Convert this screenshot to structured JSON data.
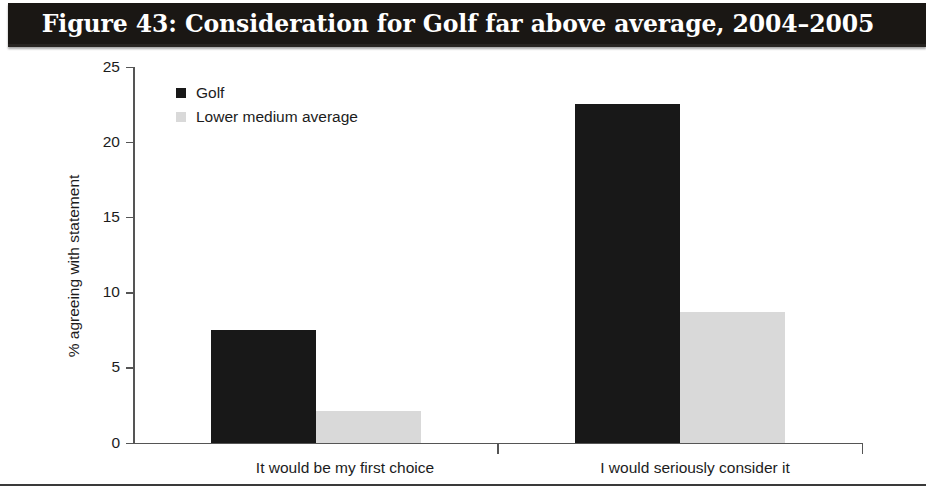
{
  "figure": {
    "title": "Figure 43: Consideration for Golf far above average, 2004–2005",
    "title_background": "#1a1714",
    "title_color": "#ffffff"
  },
  "legend": {
    "position": "top-left-inside",
    "entries": [
      {
        "label": "Golf",
        "color": "#181818",
        "swatch_icon": "filled-square-icon"
      },
      {
        "label": "Lower medium average",
        "color": "#d9d9d9",
        "swatch_icon": "filled-square-icon"
      }
    ]
  },
  "axes": {
    "y_label": "% agreeing with statement",
    "y_ticks": [
      "0",
      "5",
      "10",
      "15",
      "20",
      "25"
    ],
    "y_min": 0,
    "y_max": 25,
    "x_categories": [
      "It would be my first choice",
      "I would seriously consider it"
    ]
  },
  "chart_data": {
    "type": "bar",
    "title": "Figure 43: Consideration for Golf far above average, 2004–2005",
    "xlabel": "",
    "ylabel": "% agreeing with statement",
    "ylim": [
      0,
      25
    ],
    "yticks": [
      0,
      5,
      10,
      15,
      20,
      25
    ],
    "grid": false,
    "legend_position": "upper left",
    "categories": [
      "It would be my first choice",
      "I would seriously consider it"
    ],
    "series": [
      {
        "name": "Golf",
        "color": "#181818",
        "values": [
          7.5,
          22.5
        ]
      },
      {
        "name": "Lower medium average",
        "color": "#d9d9d9",
        "values": [
          2.1,
          8.7
        ]
      }
    ]
  }
}
